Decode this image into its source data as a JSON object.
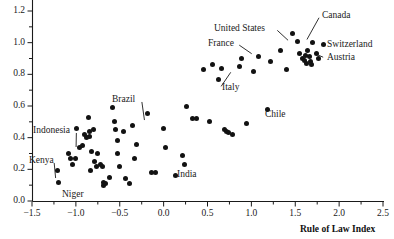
{
  "chart_data": {
    "type": "scatter",
    "title": "",
    "xlabel": "Rule of Law Index",
    "ylabel": "",
    "xlim": [
      -1.6,
      2.62
    ],
    "ylim": [
      -0.02,
      1.28
    ],
    "grid": false,
    "legend": null,
    "xticks": [
      -1.5,
      -1.0,
      -0.5,
      0.0,
      0.5,
      1.0,
      1.5,
      2.0,
      2.5
    ],
    "xtick_labels": [
      "-1.5",
      "-1.0",
      "-0.5",
      "0.0",
      "0.5",
      "1.0",
      "1.5",
      "2.0",
      "2.5"
    ],
    "x_minor_ticks": [
      -1.25,
      -0.75,
      -0.25,
      0.25,
      0.75,
      1.25,
      1.75,
      2.25
    ],
    "yticks": [
      0.0,
      0.2,
      0.4,
      0.6,
      0.8,
      1.0,
      1.2
    ],
    "ytick_labels": [
      "0.0",
      "0.2",
      "0.4",
      "0.6",
      "0.8",
      "1.0",
      "1.2"
    ],
    "y_minor_ticks": [
      0.1,
      0.3,
      0.5,
      0.7,
      0.9,
      1.1
    ],
    "marker": "filled-circle",
    "marker_color": "#121212",
    "points": [
      {
        "x": -1.21,
        "y": 0.19
      },
      {
        "x": -1.2,
        "y": 0.12
      },
      {
        "x": -1.08,
        "y": 0.3
      },
      {
        "x": -1.06,
        "y": 0.27
      },
      {
        "x": -1.04,
        "y": 0.23
      },
      {
        "x": -1.0,
        "y": 0.27
      },
      {
        "x": -0.99,
        "y": 0.46
      },
      {
        "x": -0.96,
        "y": 0.34
      },
      {
        "x": -0.93,
        "y": 0.35
      },
      {
        "x": -0.9,
        "y": 0.42
      },
      {
        "x": -0.88,
        "y": 0.4
      },
      {
        "x": -0.86,
        "y": 0.53
      },
      {
        "x": -0.85,
        "y": 0.44
      },
      {
        "x": -0.84,
        "y": 0.41
      },
      {
        "x": -0.83,
        "y": 0.19
      },
      {
        "x": -0.82,
        "y": 0.31
      },
      {
        "x": -0.8,
        "y": 0.45
      },
      {
        "x": -0.79,
        "y": 0.25
      },
      {
        "x": -0.77,
        "y": 0.22
      },
      {
        "x": -0.75,
        "y": 0.3
      },
      {
        "x": -0.72,
        "y": 0.23
      },
      {
        "x": -0.7,
        "y": 0.22
      },
      {
        "x": -0.68,
        "y": 0.12
      },
      {
        "x": -0.68,
        "y": 0.1
      },
      {
        "x": -0.66,
        "y": 0.11
      },
      {
        "x": -0.62,
        "y": 0.15
      },
      {
        "x": -0.58,
        "y": 0.59
      },
      {
        "x": -0.56,
        "y": 0.5
      },
      {
        "x": -0.55,
        "y": 0.45
      },
      {
        "x": -0.53,
        "y": 0.38
      },
      {
        "x": -0.52,
        "y": 0.3
      },
      {
        "x": -0.5,
        "y": 0.22
      },
      {
        "x": -0.46,
        "y": 0.44
      },
      {
        "x": -0.43,
        "y": 0.14
      },
      {
        "x": -0.39,
        "y": 0.11
      },
      {
        "x": -0.35,
        "y": 0.48
      },
      {
        "x": -0.33,
        "y": 0.27
      },
      {
        "x": -0.31,
        "y": 0.36
      },
      {
        "x": -0.18,
        "y": 0.55
      },
      {
        "x": -0.14,
        "y": 0.18
      },
      {
        "x": -0.09,
        "y": 0.18
      },
      {
        "x": 0.0,
        "y": 0.46
      },
      {
        "x": 0.02,
        "y": 0.34
      },
      {
        "x": 0.14,
        "y": 0.16
      },
      {
        "x": 0.22,
        "y": 0.29
      },
      {
        "x": 0.24,
        "y": 0.23
      },
      {
        "x": 0.26,
        "y": 0.6
      },
      {
        "x": 0.33,
        "y": 0.52
      },
      {
        "x": 0.37,
        "y": 0.52
      },
      {
        "x": 0.45,
        "y": 0.83
      },
      {
        "x": 0.52,
        "y": 0.5
      },
      {
        "x": 0.56,
        "y": 0.86
      },
      {
        "x": 0.62,
        "y": 0.77
      },
      {
        "x": 0.66,
        "y": 0.84
      },
      {
        "x": 0.69,
        "y": 0.45
      },
      {
        "x": 0.72,
        "y": 0.44
      },
      {
        "x": 0.74,
        "y": 0.43
      },
      {
        "x": 0.79,
        "y": 0.42
      },
      {
        "x": 0.86,
        "y": 0.85
      },
      {
        "x": 0.89,
        "y": 0.9
      },
      {
        "x": 0.95,
        "y": 0.49
      },
      {
        "x": 1.02,
        "y": 0.82
      },
      {
        "x": 1.08,
        "y": 0.91
      },
      {
        "x": 1.18,
        "y": 0.58
      },
      {
        "x": 1.22,
        "y": 0.88
      },
      {
        "x": 1.33,
        "y": 0.95
      },
      {
        "x": 1.4,
        "y": 0.83
      },
      {
        "x": 1.47,
        "y": 1.06
      },
      {
        "x": 1.52,
        "y": 1.01
      },
      {
        "x": 1.55,
        "y": 0.93
      },
      {
        "x": 1.58,
        "y": 0.9
      },
      {
        "x": 1.6,
        "y": 0.89
      },
      {
        "x": 1.62,
        "y": 0.92
      },
      {
        "x": 1.63,
        "y": 0.87
      },
      {
        "x": 1.64,
        "y": 0.95
      },
      {
        "x": 1.66,
        "y": 0.91
      },
      {
        "x": 1.67,
        "y": 0.88
      },
      {
        "x": 1.69,
        "y": 0.86
      },
      {
        "x": 1.7,
        "y": 1.0
      },
      {
        "x": 1.74,
        "y": 0.93
      },
      {
        "x": 1.77,
        "y": 0.9
      },
      {
        "x": 1.82,
        "y": 0.99
      }
    ],
    "annotations": [
      {
        "label": "United States",
        "text_x": 214,
        "text_y": 24,
        "px": 291,
        "py": 43
      },
      {
        "label": "Canada",
        "text_x": 322,
        "text_y": 11,
        "px": 305,
        "py": 43
      },
      {
        "label": "France",
        "text_x": 208,
        "text_y": 39,
        "px": 255,
        "py": 56
      },
      {
        "label": "Switzerland",
        "text_x": 327,
        "text_y": 40,
        "px": 318,
        "py": 43
      },
      {
        "label": "Austria",
        "text_x": 327,
        "text_y": 53,
        "px": 311,
        "py": 52
      },
      {
        "label": "Italy",
        "text_x": 222,
        "text_y": 83,
        "px": 233,
        "py": 69
      },
      {
        "label": "Chile",
        "text_x": 265,
        "text_y": 110,
        "px": 255,
        "py": 110
      },
      {
        "label": "Brazil",
        "text_x": 112,
        "text_y": 95,
        "px": 145,
        "py": 124
      },
      {
        "label": "Indonesia",
        "text_x": 33,
        "text_y": 126,
        "px": 76,
        "py": 151
      },
      {
        "label": "Kenya",
        "text_x": 29,
        "text_y": 156,
        "px": 56,
        "py": 182
      },
      {
        "label": "Niger",
        "text_x": 62,
        "text_y": 190,
        "px": 57,
        "py": 192
      },
      {
        "label": "India",
        "text_x": 177,
        "text_y": 170,
        "px": 172,
        "py": 170
      }
    ]
  },
  "axis": {
    "x_title": "Rule of Law Index"
  },
  "colors": {
    "marker": "#121212",
    "axis": "#1a1a1a",
    "background": "#ffffff"
  }
}
